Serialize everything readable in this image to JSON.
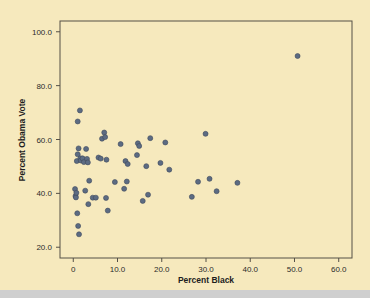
{
  "figure": {
    "background_color": "#f6e9bd",
    "marker_color": "#5c6b82",
    "frame_color": "#555047"
  },
  "chart_data": {
    "type": "scatter",
    "title": "",
    "xlabel": "Percent Black",
    "ylabel": "Percent Obama Vote",
    "xlim": [
      -3.0,
      63.0
    ],
    "ylim": [
      16.0,
      104.0
    ],
    "xticks": [
      0,
      10,
      20,
      30,
      40,
      50,
      60
    ],
    "xticklabels": [
      "0",
      "10.0",
      "20.0",
      "30.0",
      "40.0",
      "50.0",
      "60.0"
    ],
    "yticks": [
      20,
      40,
      60,
      80,
      100
    ],
    "yticklabels": [
      "20.0",
      "40.0",
      "60.0",
      "80.0",
      "100.0"
    ],
    "grid": false,
    "legend": null,
    "points": [
      [
        0.4,
        41.6
      ],
      [
        0.5,
        39.0
      ],
      [
        0.6,
        38.5
      ],
      [
        0.7,
        40.2
      ],
      [
        0.8,
        52.0
      ],
      [
        0.9,
        32.6
      ],
      [
        1.0,
        66.7
      ],
      [
        1.0,
        54.5
      ],
      [
        1.1,
        27.9
      ],
      [
        1.2,
        56.7
      ],
      [
        1.3,
        24.8
      ],
      [
        1.5,
        70.8
      ],
      [
        1.6,
        53.0
      ],
      [
        1.7,
        52.2
      ],
      [
        2.1,
        53.0
      ],
      [
        2.4,
        51.6
      ],
      [
        2.7,
        41.0
      ],
      [
        2.9,
        56.5
      ],
      [
        3.1,
        52.8
      ],
      [
        3.3,
        51.5
      ],
      [
        3.4,
        36.0
      ],
      [
        3.6,
        44.7
      ],
      [
        4.4,
        38.4
      ],
      [
        5.1,
        38.4
      ],
      [
        5.7,
        53.3
      ],
      [
        6.2,
        52.9
      ],
      [
        6.5,
        60.3
      ],
      [
        7.0,
        62.6
      ],
      [
        7.2,
        60.9
      ],
      [
        7.4,
        38.3
      ],
      [
        7.5,
        52.5
      ],
      [
        7.8,
        33.6
      ],
      [
        9.4,
        44.2
      ],
      [
        10.7,
        58.3
      ],
      [
        11.5,
        41.7
      ],
      [
        11.8,
        52.0
      ],
      [
        12.1,
        44.4
      ],
      [
        12.3,
        50.9
      ],
      [
        14.4,
        54.2
      ],
      [
        14.6,
        58.6
      ],
      [
        14.9,
        57.6
      ],
      [
        15.7,
        37.2
      ],
      [
        16.5,
        50.1
      ],
      [
        16.9,
        39.5
      ],
      [
        17.4,
        60.5
      ],
      [
        19.7,
        51.3
      ],
      [
        20.8,
        58.9
      ],
      [
        21.7,
        48.8
      ],
      [
        26.8,
        38.7
      ],
      [
        28.2,
        44.3
      ],
      [
        29.9,
        62.1
      ],
      [
        30.8,
        45.4
      ],
      [
        32.4,
        40.8
      ],
      [
        37.1,
        43.9
      ],
      [
        50.7,
        91.0
      ]
    ]
  }
}
